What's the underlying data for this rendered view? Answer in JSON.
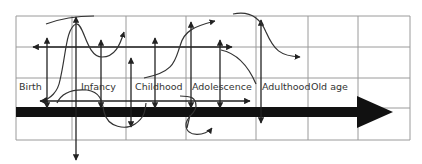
{
  "diagram": {
    "stages": [
      {
        "label": "Birth",
        "x": 19
      },
      {
        "label": "Infancy",
        "x": 81
      },
      {
        "label": "Childhood",
        "x": 135
      },
      {
        "label": "Adolescence",
        "x": 192
      },
      {
        "label": "Adulthood",
        "x": 262
      },
      {
        "label": "Old age",
        "x": 311
      }
    ],
    "labels_y": 82,
    "grid": {
      "x_lines": [
        16,
        72,
        126,
        186,
        256,
        308,
        358,
        410
      ],
      "y_lines": [
        16,
        47,
        78,
        108,
        140
      ],
      "color": "#9a9a9a"
    },
    "timeline_arrow": {
      "x_start": 16,
      "x_end": 393,
      "y": 112,
      "thickness": 10,
      "head_width": 32,
      "head_length": 36,
      "color": "#111111"
    }
  }
}
